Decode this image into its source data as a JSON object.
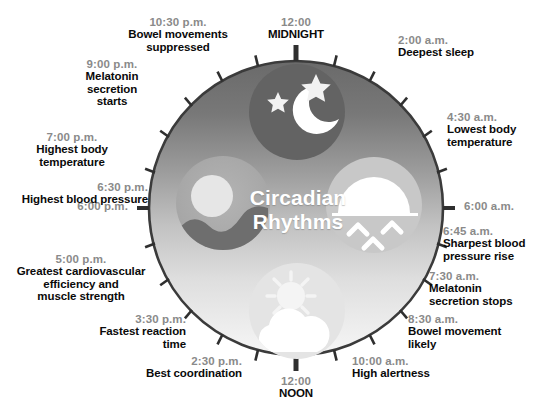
{
  "diagram": {
    "title_line1": "Circadian",
    "title_line2": "Rhythms",
    "colors": {
      "time_text": "#8a8a8a",
      "desc_text": "#0a0a0a",
      "rim": "#3b3b3b",
      "night_top": "#6e6e6e",
      "day_bottom": "#f2f2f2",
      "title_text": "#ffffff"
    }
  },
  "markers": [
    {
      "id": "midnight",
      "time": "12:00",
      "desc": "MIDNIGHT",
      "angle_deg": 0,
      "align": "c"
    },
    {
      "id": "t0200",
      "time": "2:00 a.m.",
      "desc": "Deepest sleep",
      "angle_deg": 30,
      "align": "l"
    },
    {
      "id": "t0430",
      "time": "4:30 a.m.",
      "desc": "Lowest body\ntemperature",
      "angle_deg": 67,
      "align": "l"
    },
    {
      "id": "t0600",
      "time": "6:00 a.m.",
      "desc": "",
      "angle_deg": 90,
      "align": "l"
    },
    {
      "id": "t0645",
      "time": "6:45 a.m.",
      "desc": "Sharpest blood\npressure rise",
      "angle_deg": 101,
      "align": "l"
    },
    {
      "id": "t0730",
      "time": "7:30 a.m.",
      "desc": "Melatonin\nsecretion stops",
      "angle_deg": 113,
      "align": "l"
    },
    {
      "id": "t0830",
      "time": "8:30 a.m.",
      "desc": "Bowel movement\nlikely",
      "angle_deg": 128,
      "align": "l"
    },
    {
      "id": "t1000",
      "time": "10:00 a.m.",
      "desc": "High alertness",
      "angle_deg": 150,
      "align": "l"
    },
    {
      "id": "noon",
      "time": "12:00",
      "desc": "NOON",
      "angle_deg": 180,
      "align": "c"
    },
    {
      "id": "t1430",
      "time": "2:30 p.m.",
      "desc": "Best coordination",
      "angle_deg": 217,
      "align": "r"
    },
    {
      "id": "t1530",
      "time": "3:30 p.m.",
      "desc": "Fastest reaction\ntime",
      "angle_deg": 232,
      "align": "r"
    },
    {
      "id": "t1700",
      "time": "5:00 p.m.",
      "desc": "Greatest cardiovascular\nefficiency and\nmuscle strength",
      "angle_deg": 255,
      "align": "r"
    },
    {
      "id": "t1800",
      "time": "6:00 p.m.",
      "desc": "",
      "angle_deg": 270,
      "align": "r"
    },
    {
      "id": "t1830",
      "time": "6:30 p.m.",
      "desc": "Highest blood pressure",
      "angle_deg": 277,
      "align": "r"
    },
    {
      "id": "t1900",
      "time": "7:00 p.m.",
      "desc": "Highest body\ntemperature",
      "angle_deg": 292,
      "align": "r"
    },
    {
      "id": "t2100",
      "time": "9:00 p.m.",
      "desc": "Melatonin\nsecretion\nstarts",
      "angle_deg": 315,
      "align": "r"
    },
    {
      "id": "t2230",
      "time": "10:30 p.m.",
      "desc": "Bowel movements\nsuppressed",
      "angle_deg": 337,
      "align": "r"
    }
  ],
  "icons": [
    {
      "id": "night-icon",
      "name": "moon-and-stars-icon",
      "position": "top"
    },
    {
      "id": "sunrise-icon",
      "name": "rising-sun-icon",
      "position": "right"
    },
    {
      "id": "noon-icon",
      "name": "sun-behind-cloud-icon",
      "position": "bottom"
    },
    {
      "id": "sunset-icon",
      "name": "setting-sun-icon",
      "position": "left"
    }
  ],
  "ticks": {
    "count": 24,
    "major_positions": [
      0,
      180
    ]
  }
}
